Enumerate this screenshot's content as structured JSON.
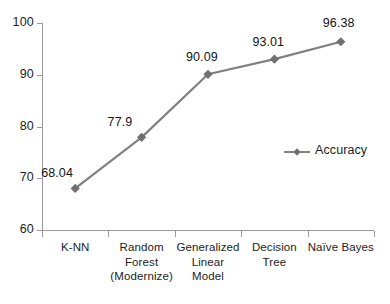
{
  "chart_data": {
    "type": "line",
    "title": "",
    "subtitle": "",
    "xlabel": "",
    "ylabel": "",
    "ylim": [
      60,
      100
    ],
    "y_ticks": [
      60,
      70,
      80,
      90,
      100
    ],
    "grid": false,
    "legend_position": "center-right",
    "categories": [
      "K-NN",
      "Random\nForest\n(Modernize)",
      "Generalized\nLinear\nModel",
      "Decision\nTree",
      "Naïve Bayes"
    ],
    "series": [
      {
        "name": "Accuracy",
        "color": "#808080",
        "marker": "diamond",
        "values": [
          68.04,
          77.9,
          90.09,
          93.01,
          96.38
        ],
        "value_labels": [
          "68.04",
          "77.9",
          "90.09",
          "93.01",
          "96.38"
        ]
      }
    ]
  },
  "axis": {
    "y_tick_labels": [
      "100",
      "90",
      "80",
      "70",
      "60"
    ]
  },
  "legend": {
    "entries": [
      {
        "label": "Accuracy",
        "marker_name": "line-diamond-marker"
      }
    ]
  }
}
